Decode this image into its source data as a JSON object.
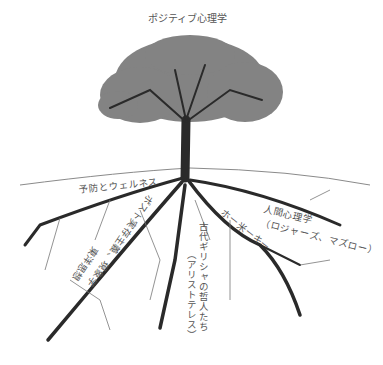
{
  "diagram": {
    "title": "ポジティブ心理学",
    "colors": {
      "ink": "#2a2a2a",
      "foliage": "#6e6e6e",
      "text": "#555555",
      "ground": "#8a8a8a"
    },
    "branch_labels": [
      {
        "id": "prevention",
        "text": "予防とウェルネス"
      },
      {
        "id": "existential",
        "text": "ポスト実存主義、現象学"
      },
      {
        "id": "eastern",
        "text": "東洋思想"
      },
      {
        "id": "greek",
        "text": "古代ギリシャの哲人たち"
      },
      {
        "id": "greek_sub",
        "text": "（アリストテレス）"
      },
      {
        "id": "diag",
        "text": "ホー米ーキー"
      },
      {
        "id": "humanistic",
        "text": "人間心理学"
      },
      {
        "id": "humanistic_sub",
        "text": "（ロジャーズ、マズロー）"
      }
    ]
  }
}
